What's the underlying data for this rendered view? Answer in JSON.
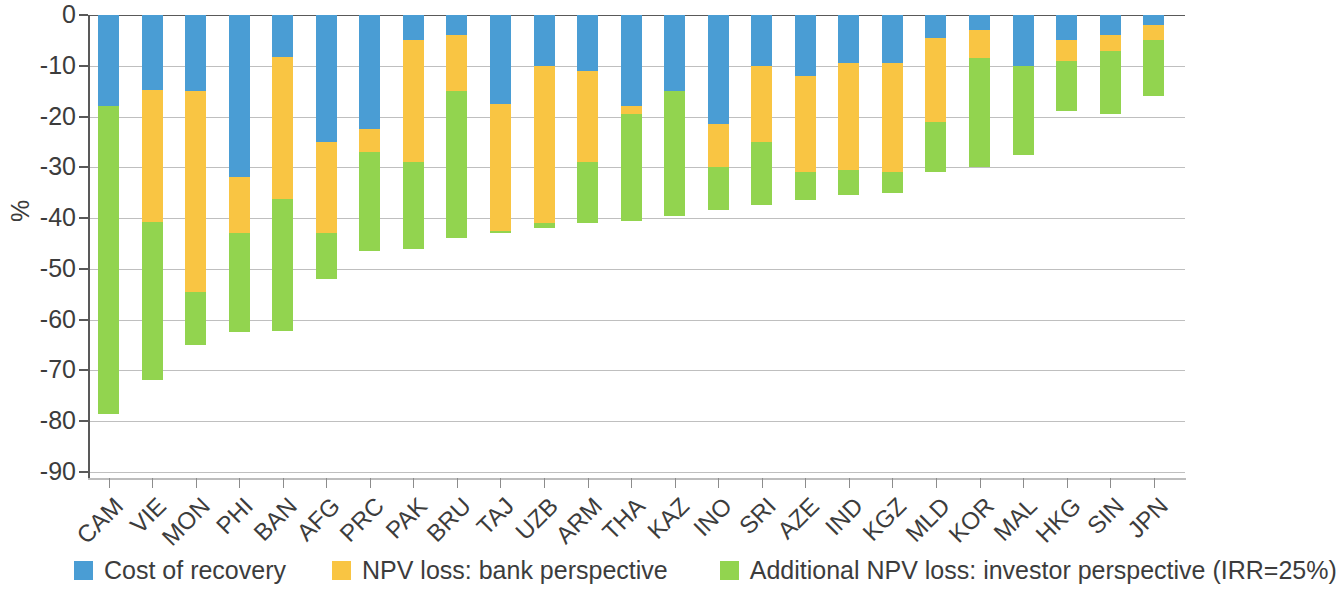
{
  "chart_data": {
    "type": "bar",
    "stacked": true,
    "title": "",
    "xlabel": "",
    "ylabel": "%",
    "ylim": [
      -90,
      0
    ],
    "ytick_labels": [
      "0",
      "-10",
      "-20",
      "-30",
      "-40",
      "-50",
      "-60",
      "-70",
      "-80",
      "-90"
    ],
    "ytick_values": [
      0,
      -10,
      -20,
      -30,
      -40,
      -50,
      -60,
      -70,
      -80,
      -90
    ],
    "grid": true,
    "legend_position": "bottom",
    "categories": [
      "CAM",
      "VIE",
      "MON",
      "PHI",
      "BAN",
      "AFG",
      "PRC",
      "PAK",
      "BRU",
      "TAJ",
      "UZB",
      "ARM",
      "THA",
      "KAZ",
      "INO",
      "SRI",
      "AZE",
      "IND",
      "KGZ",
      "MLD",
      "KOR",
      "MAL",
      "HKG",
      "SIN",
      "JPN"
    ],
    "series": [
      {
        "name": "Cost of recovery",
        "color": "#4a9dd4",
        "values": [
          -18.0,
          -14.8,
          -15.0,
          -32.0,
          -8.2,
          -25.0,
          -22.5,
          -5.0,
          -4.0,
          -17.5,
          -10.0,
          -11.0,
          -18.0,
          -15.0,
          -21.5,
          -10.0,
          -12.0,
          -9.5,
          -9.5,
          -4.5,
          -3.0,
          -10.0,
          -5.0,
          -4.0,
          -2.0
        ]
      },
      {
        "name": "NPV loss: bank perspective",
        "color": "#f9c543",
        "values": [
          0.0,
          -26.0,
          -39.5,
          -11.0,
          -28.0,
          -18.0,
          -4.5,
          -24.0,
          -11.0,
          -25.0,
          -31.0,
          -18.0,
          -1.5,
          0.0,
          -8.5,
          -15.0,
          -19.0,
          -21.0,
          -21.5,
          -16.5,
          -5.5,
          0.0,
          -4.0,
          -3.0,
          -3.0
        ]
      },
      {
        "name": "Additional NPV loss: investor perspective (IRR=25%)",
        "color": "#92d44f",
        "values": [
          -60.5,
          -31.0,
          -10.5,
          -19.5,
          -26.0,
          -9.0,
          -19.5,
          -17.0,
          -29.0,
          -0.5,
          -1.0,
          -12.0,
          -21.0,
          -24.5,
          -8.5,
          -12.5,
          -5.5,
          -5.0,
          -4.0,
          -10.0,
          -21.5,
          -17.5,
          -10.0,
          -12.5,
          -11.0
        ]
      }
    ],
    "totals": [
      -78.5,
      -71.8,
      -65.0,
      -62.5,
      -62.2,
      -52.0,
      -46.5,
      -46.0,
      -44.0,
      -43.0,
      -42.0,
      -41.0,
      -40.5,
      -39.5,
      -38.5,
      -37.5,
      -36.5,
      -35.5,
      -35.0,
      -31.0,
      -30.0,
      -27.5,
      -19.0,
      -19.5,
      -16.0
    ]
  },
  "legend": {
    "items": [
      {
        "label": "Cost of recovery",
        "color": "#4a9dd4"
      },
      {
        "label": "NPV loss: bank perspective",
        "color": "#f9c543"
      },
      {
        "label": "Additional NPV loss: investor perspective (IRR=25%)",
        "color": "#92d44f"
      }
    ]
  }
}
